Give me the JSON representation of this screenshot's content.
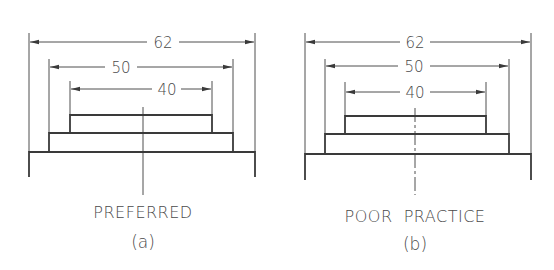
{
  "figures": [
    {
      "id": "a",
      "caption": "PREFERRED",
      "sub_label": "(a)",
      "center_line_style": "solid",
      "dimensions": [
        {
          "label": "62",
          "x1": 29,
          "x2": 255,
          "y": 42,
          "ext_top": 33
        },
        {
          "label": "50",
          "x1": 49,
          "x2": 233,
          "y": 67,
          "ext_top": 59
        },
        {
          "label": "40",
          "x1": 70,
          "x2": 212,
          "y": 89,
          "ext_top": 81
        }
      ],
      "blocks": [
        {
          "name": "top-block",
          "x1": 70,
          "x2": 212,
          "y1": 115,
          "y2": 133
        },
        {
          "name": "middle-block",
          "x1": 49,
          "x2": 233,
          "y1": 133,
          "y2": 152
        },
        {
          "name": "base-block",
          "x1": 29,
          "x2": 255,
          "y1": 152,
          "y2": 177
        }
      ],
      "center_x": 143
    },
    {
      "id": "b",
      "caption": "POOR  PRACTICE",
      "sub_label": "(b)",
      "center_line_style": "dashed",
      "dimensions": [
        {
          "label": "62",
          "x1": 305,
          "x2": 531,
          "y": 42,
          "ext_top": 33
        },
        {
          "label": "50",
          "x1": 325,
          "x2": 509,
          "y": 66,
          "ext_top": 59
        },
        {
          "label": "40",
          "x1": 345,
          "x2": 486,
          "y": 92,
          "ext_top": 82
        }
      ],
      "blocks": [
        {
          "name": "top-block",
          "x1": 345,
          "x2": 486,
          "y1": 116,
          "y2": 134
        },
        {
          "name": "middle-block",
          "x1": 325,
          "x2": 509,
          "y1": 134,
          "y2": 154
        },
        {
          "name": "base-block",
          "x1": 305,
          "x2": 531,
          "y1": 154,
          "y2": 180
        }
      ],
      "center_x": 415
    }
  ],
  "labels": {
    "a_dim_62": "62",
    "a_dim_50": "50",
    "a_dim_40": "40",
    "a_caption": "PREFERRED",
    "a_sub": "(a)",
    "b_dim_62": "62",
    "b_dim_50": "50",
    "b_dim_40": "40",
    "b_caption": "POOR  PRACTICE",
    "b_sub": "(b)"
  }
}
